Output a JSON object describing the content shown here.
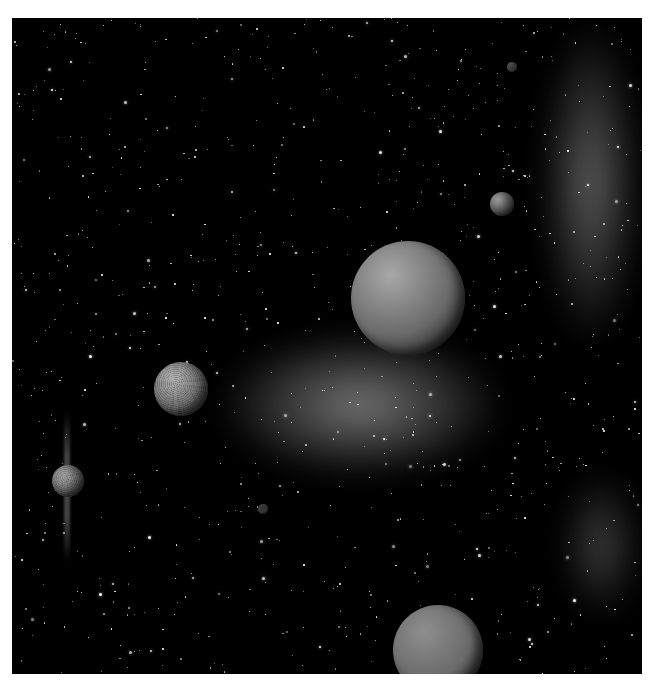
{
  "scene": {
    "description": "Monochrome space artwork: starfield with grey nebula clouds and several planets/moons",
    "background_color": "#000000",
    "border_color": "#ffffff",
    "frame": {
      "x": 12,
      "y": 18,
      "width": 630,
      "height": 656
    }
  },
  "planets": [
    {
      "name": "large-planet-center",
      "cx": 408,
      "cy": 298,
      "r": 57,
      "texture": "smooth",
      "tone": "#a8a8a8"
    },
    {
      "name": "cratered-planet-left",
      "cx": 181,
      "cy": 389,
      "r": 27,
      "texture": "cratered",
      "tone": "#b0b0b0"
    },
    {
      "name": "ringed-moon-far-left",
      "cx": 68,
      "cy": 481,
      "r": 16,
      "texture": "cratered",
      "tone": "#a0a0a0"
    },
    {
      "name": "small-moon-upper-right",
      "cx": 502,
      "cy": 204,
      "r": 12,
      "texture": "smooth",
      "tone": "#9a9a9a"
    },
    {
      "name": "tiny-moon-top-right",
      "cx": 512,
      "cy": 67,
      "r": 5,
      "texture": "smooth",
      "tone": "#777777"
    },
    {
      "name": "bottom-planet-partial",
      "cx": 438,
      "cy": 650,
      "r": 45,
      "texture": "smooth",
      "tone": "#8e8e8e"
    },
    {
      "name": "faint-moon-lower",
      "cx": 263,
      "cy": 509,
      "r": 5,
      "texture": "smooth",
      "tone": "#555555"
    }
  ],
  "nebulae": [
    {
      "name": "nebula-central-arm",
      "x": 215,
      "y": 330,
      "w": 290,
      "h": 150,
      "color": "#8a8a8a"
    },
    {
      "name": "nebula-right-upper",
      "x": 540,
      "y": 18,
      "w": 102,
      "h": 330,
      "color": "#6e6e6e"
    },
    {
      "name": "nebula-right-lower",
      "x": 560,
      "y": 470,
      "w": 82,
      "h": 150,
      "color": "#4a4a4a"
    }
  ]
}
